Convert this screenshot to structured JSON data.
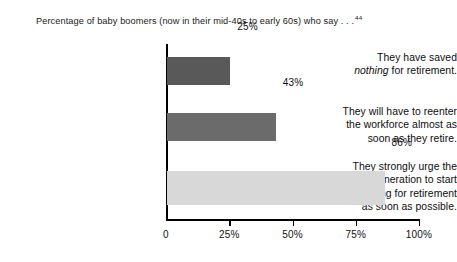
{
  "chart_data": {
    "type": "bar",
    "orientation": "horizontal",
    "title": "Percentage of baby boomers (now in their mid-40s to early 60s) who say . . .",
    "title_footnote": "44",
    "xlabel": "",
    "ylabel": "",
    "xlim": [
      0,
      100
    ],
    "grid": false,
    "legend": "none",
    "categories": [
      "They have saved nothing for retirement.",
      "They will have to reenter the workforce almost as soon as they retire.",
      "They strongly urge the next generation to start saving for retirement as soon as possible."
    ],
    "values": [
      25,
      43,
      86
    ],
    "value_labels": [
      "25%",
      "43%",
      "86%"
    ],
    "bar_colors": [
      "#595959",
      "#6b6b6b",
      "#d8d8d8"
    ],
    "xticks": [
      0,
      25,
      50,
      75,
      100
    ],
    "xtick_labels": [
      "0",
      "25%",
      "50%",
      "75%",
      "100%"
    ],
    "category_label_lines": [
      [
        "They have saved",
        "nothing for retirement."
      ],
      [
        "They will have to reenter",
        "the workforce almost as",
        "soon as they retire."
      ],
      [
        "They strongly urge the",
        "next generation to start",
        "saving for retirement",
        "as soon as possible."
      ]
    ]
  },
  "axis_color": "#000000",
  "text_color": "#111111"
}
